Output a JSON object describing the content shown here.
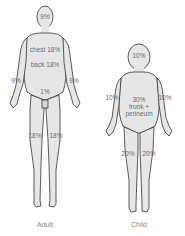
{
  "figures": [
    {
      "caption": "Adult",
      "regions": {
        "head": "9%",
        "chest": "chest 18%",
        "back": "back 18%",
        "left_arm": "9%",
        "right_arm": "9%",
        "perineum": "1%",
        "left_leg": "18%",
        "right_leg": "18%"
      }
    },
    {
      "caption": "Child",
      "regions": {
        "head": "10%",
        "left_arm": "10%",
        "right_arm": "10%",
        "trunk_line1": "30%",
        "trunk_line2": "trunk +",
        "trunk_line3": "perineum",
        "left_leg": "20%",
        "right_leg": "20%"
      }
    }
  ],
  "colors": {
    "body_fill": "#e6e6e6",
    "outline": "#333333",
    "text": "#666666"
  }
}
